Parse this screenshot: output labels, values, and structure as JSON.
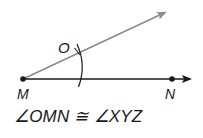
{
  "diagram": {
    "type": "geometry-construction",
    "points": {
      "M": {
        "label": "M",
        "x": 23,
        "y": 79
      },
      "N": {
        "label": "N",
        "x": 172,
        "y": 79
      },
      "O": {
        "label": "O",
        "x": 77,
        "y": 52
      }
    },
    "rays": [
      {
        "name": "ray-MN",
        "from": "M",
        "to": [
          190,
          79
        ],
        "color": "#1a1a1a"
      },
      {
        "name": "ray-MO",
        "from": "M",
        "to": [
          166,
          12
        ],
        "color": "#8a8a8a"
      }
    ],
    "arc": {
      "center": "M",
      "radius": 56,
      "color": "#1a1a1a"
    },
    "caption": "∠OMN ≅ ∠XYZ"
  },
  "labels": {
    "M": "M",
    "N": "N",
    "O": "O"
  },
  "colors": {
    "ink": "#1a1a1a",
    "gray_ray": "#8a8a8a",
    "background": "#ffffff"
  }
}
